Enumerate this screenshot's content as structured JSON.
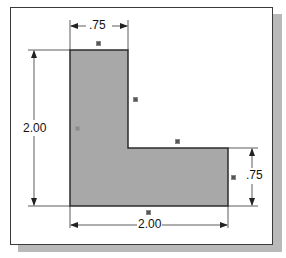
{
  "drawing": {
    "title": "",
    "shape": "L-shape profile",
    "fill_color": "#a8a8a8",
    "outline_color": "#2b2b2b",
    "dimensions": {
      "top_width": ".75",
      "left_height": "2.00",
      "right_height": ".75",
      "bottom_width": "2.00"
    },
    "constraint_markers": [
      {
        "location": "top-edge",
        "symbol": "horizontal-constraint-icon"
      },
      {
        "location": "inner-vertical-edge",
        "symbol": "vertical-constraint-icon"
      },
      {
        "location": "inner-horizontal-edge",
        "symbol": "horizontal-constraint-icon"
      },
      {
        "location": "right-edge",
        "symbol": "vertical-constraint-icon"
      },
      {
        "location": "bottom-edge",
        "symbol": "horizontal-constraint-icon"
      },
      {
        "location": "left-edge",
        "symbol": "vertical-constraint-icon"
      }
    ]
  }
}
